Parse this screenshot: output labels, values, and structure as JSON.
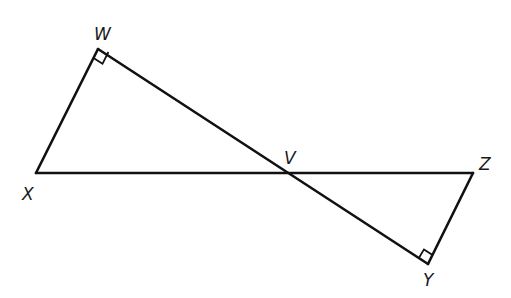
{
  "diagram": {
    "type": "geometry",
    "points": {
      "W": {
        "label": "W",
        "x": 98,
        "y": 49
      },
      "X": {
        "label": "X",
        "x": 36,
        "y": 173
      },
      "V": {
        "label": "V",
        "x": 287,
        "y": 173
      },
      "Z": {
        "label": "Z",
        "x": 473,
        "y": 173
      },
      "Y": {
        "label": "Y",
        "x": 428,
        "y": 264
      }
    },
    "segments": [
      {
        "from": "X",
        "to": "W"
      },
      {
        "from": "W",
        "to": "Y"
      },
      {
        "from": "X",
        "to": "Z"
      },
      {
        "from": "Z",
        "to": "Y"
      }
    ],
    "right_angles": [
      {
        "vertex": "W",
        "between": [
          "X",
          "V"
        ]
      },
      {
        "vertex": "Y",
        "between": [
          "V",
          "Z"
        ]
      }
    ],
    "colors": {
      "stroke": "#111111",
      "label": "#1a1a1a",
      "background": "#ffffff"
    }
  }
}
